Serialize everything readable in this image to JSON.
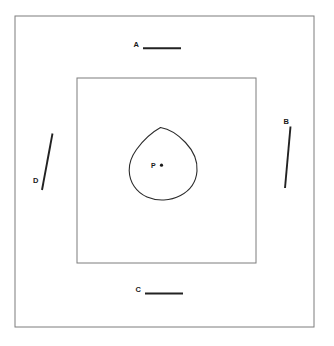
{
  "figure": {
    "background_color": "#ffffff",
    "outer_rectangle": {
      "name": "outer-boundary-rectangle",
      "x": 15,
      "y": 16,
      "width": 299,
      "height": 311,
      "stroke_color": "#7d7d7d"
    },
    "inner_rectangle": {
      "name": "inner-square",
      "x": 77,
      "y": 78,
      "width": 179,
      "height": 185,
      "stroke_color": "#7d7d7d"
    },
    "closed_curve": {
      "name": "teardrop-blob",
      "stroke_color": "#2b2b2b",
      "bounds": {
        "left": 129,
        "right": 197,
        "top": 127,
        "bottom": 200
      },
      "path": "M 160.5 127.5 C 151.5 132.5 143.0 140.5 136.5 149.5 C 131.5 156.5 129.0 163.5 129.2 170.5 C 129.5 182.5 136.5 192.5 147.0 197.0 C 157.5 201.5 170.5 200.8 180.5 195.5 C 190.0 190.5 196.2 181.5 197.0 171.0 C 197.8 160.5 193.0 150.5 185.5 142.5 C 178.0 134.5 169.5 129.0 160.5 127.5 Z"
    },
    "point": {
      "name": "point-p",
      "label": "P",
      "label_x": 151,
      "label_y": 168,
      "dot_x": 161.5,
      "dot_y": 165.2,
      "dot_r": 1.6
    },
    "segments": [
      {
        "name": "segment-a",
        "label": "A",
        "label_x": 133.5,
        "label_y": 46.5,
        "x1": 143,
        "y1": 48.2,
        "x2": 181,
        "y2": 48.2,
        "orientation": "horizontal",
        "position": "top"
      },
      {
        "name": "segment-b",
        "label": "B",
        "label_x": 283.5,
        "label_y": 124.0,
        "x1": 290.5,
        "y1": 126.5,
        "x2": 285.0,
        "y2": 188.0,
        "orientation": "slanted",
        "position": "right"
      },
      {
        "name": "segment-c",
        "label": "C",
        "label_x": 135.5,
        "label_y": 291.5,
        "x1": 145,
        "y1": 293.5,
        "x2": 183,
        "y2": 293.5,
        "orientation": "horizontal",
        "position": "bottom"
      },
      {
        "name": "segment-d",
        "label": "D",
        "label_x": 33.0,
        "label_y": 183.0,
        "x1": 52.5,
        "y1": 133.5,
        "x2": 42.0,
        "y2": 190.0,
        "orientation": "slanted",
        "position": "left"
      }
    ]
  }
}
